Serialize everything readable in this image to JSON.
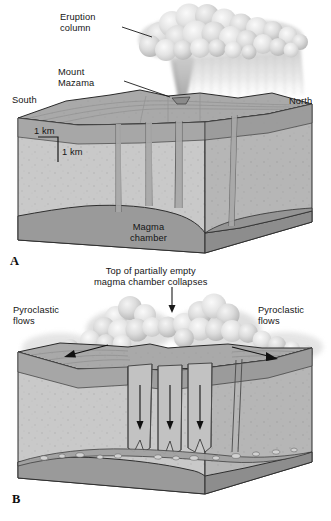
{
  "figure": {
    "type": "geologic-block-diagram",
    "background_color": "#ffffff",
    "panels": [
      {
        "letter": "A",
        "caption": "Eruption and emptying of the magma chamber",
        "labels": {
          "eruption_column": "Eruption\ncolumn",
          "mount_mazama": "Mount\nMazama",
          "south": "South",
          "north": "North",
          "magma_chamber": "Magma\nchamber",
          "scale_horizontal": "1 km",
          "scale_vertical": "1 km"
        }
      },
      {
        "letter": "B",
        "caption": "Collapse of the roof forming the caldera",
        "labels": {
          "collapse_note": "Top of partially empty\nmagma chamber collapses",
          "pyroclastic_flows_left": "Pyroclastic\nflows",
          "pyroclastic_flows_right": "Pyroclastic\nflows"
        }
      }
    ],
    "colors": {
      "rock_front": "#c9c9c9",
      "rock_side": "#b4b4b4",
      "surface_top": "#a8a8a8",
      "surface_top_dark": "#9d9d9d",
      "magma": "#9a9a9a",
      "magma_dark": "#8d8d8d",
      "conduit": "#a5a5a5",
      "outline": "#2a2a2a",
      "cloud_light": "#e8e8e8",
      "cloud_mid": "#cdcdcd",
      "text": "#151515"
    }
  }
}
